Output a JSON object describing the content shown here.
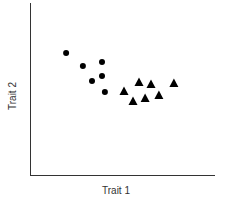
{
  "chart_data": {
    "type": "scatter",
    "title": "",
    "xlabel": "Trait 1",
    "ylabel": "Trait 2",
    "xlim": [
      0,
      10
    ],
    "ylim": [
      0,
      10
    ],
    "grid": false,
    "ticks": false,
    "legend": null,
    "series": [
      {
        "name": "circles",
        "marker": "circle",
        "color": "#000000",
        "points": [
          {
            "x": 1.95,
            "y": 7.09
          },
          {
            "x": 2.86,
            "y": 6.34
          },
          {
            "x": 3.89,
            "y": 6.57
          },
          {
            "x": 3.35,
            "y": 5.47
          },
          {
            "x": 3.89,
            "y": 5.76
          },
          {
            "x": 4.05,
            "y": 4.83
          }
        ]
      },
      {
        "name": "triangles",
        "marker": "triangle",
        "color": "#000000",
        "points": [
          {
            "x": 5.08,
            "y": 4.88
          },
          {
            "x": 5.89,
            "y": 5.41
          },
          {
            "x": 6.54,
            "y": 5.29
          },
          {
            "x": 7.78,
            "y": 5.35
          },
          {
            "x": 5.57,
            "y": 4.3
          },
          {
            "x": 6.22,
            "y": 4.48
          },
          {
            "x": 6.97,
            "y": 4.65
          }
        ]
      }
    ]
  },
  "colors": {
    "axis": "#333333",
    "marker": "#000000",
    "background": "#ffffff"
  }
}
